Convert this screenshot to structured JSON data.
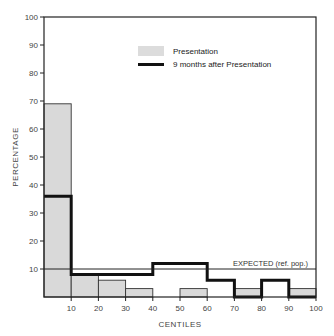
{
  "chart_data": {
    "type": "bar",
    "title": "",
    "xlabel": "CENTILES",
    "ylabel": "PERCENTAGE",
    "ylim": [
      0,
      100
    ],
    "xlim": [
      0,
      100
    ],
    "grid": false,
    "legend_position": "upper-right",
    "x_ticks": [
      "10",
      "20",
      "30",
      "40",
      "50",
      "60",
      "70",
      "80",
      "90",
      "100"
    ],
    "y_ticks": [
      "10",
      "20",
      "30",
      "40",
      "50",
      "60",
      "70",
      "80",
      "90",
      "100"
    ],
    "categories": [
      "0-10",
      "10-20",
      "20-30",
      "30-40",
      "40-50",
      "50-60",
      "60-70",
      "70-80",
      "80-90",
      "90-100"
    ],
    "series": [
      {
        "name": "Presentation",
        "style": "shaded-bars",
        "color": "#d9d9d9",
        "values": [
          69,
          8,
          6,
          3,
          0,
          3,
          0,
          3,
          0,
          3
        ]
      },
      {
        "name": "9 months after Presentation",
        "style": "thick-step-line",
        "color": "#111111",
        "values": [
          36,
          8,
          8,
          8,
          12,
          12,
          6,
          0,
          6,
          0
        ]
      }
    ],
    "reference_line": {
      "label": "EXPECTED (ref. pop.)",
      "value": 10
    }
  },
  "colors": {
    "bar_fill": "#d9d9d9",
    "line": "#111111",
    "axis": "#222222"
  }
}
